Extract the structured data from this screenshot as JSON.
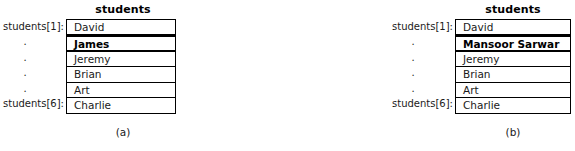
{
  "figure": {
    "panels": [
      {
        "id": "a",
        "header": "students",
        "caption": "(a)",
        "index_labels": [
          "students[1]:",
          ".",
          ".",
          ".",
          ".",
          "students[6]:"
        ],
        "cells": [
          {
            "value": "David",
            "highlighted": false
          },
          {
            "value": "James",
            "highlighted": true
          },
          {
            "value": "Jeremy",
            "highlighted": false
          },
          {
            "value": "Brian",
            "highlighted": false
          },
          {
            "value": "Art",
            "highlighted": false
          },
          {
            "value": "Charlie",
            "highlighted": false
          }
        ]
      },
      {
        "id": "b",
        "header": "students",
        "caption": "(b)",
        "index_labels": [
          "students[1]:",
          ".",
          ".",
          ".",
          ".",
          "students[6]:"
        ],
        "cells": [
          {
            "value": "David",
            "highlighted": false
          },
          {
            "value": "Mansoor Sarwar",
            "highlighted": true
          },
          {
            "value": "Jeremy",
            "highlighted": false
          },
          {
            "value": "Brian",
            "highlighted": false
          },
          {
            "value": "Art",
            "highlighted": false
          },
          {
            "value": "Charlie",
            "highlighted": false
          }
        ]
      }
    ],
    "colors": {
      "border": "#000000",
      "text": "#1a1a1a",
      "background": "#ffffff"
    }
  }
}
